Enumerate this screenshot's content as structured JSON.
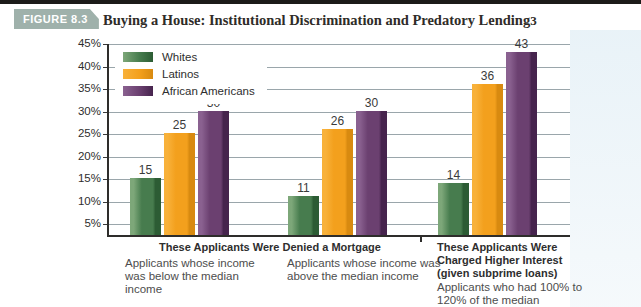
{
  "header": {
    "figure_label": "FIGURE 8.3",
    "title": "Buying a House: Institutional Discrimination and Predatory Lending",
    "footnote_marker": "3",
    "badge_color": "#9fb1ab"
  },
  "chart_data": {
    "type": "bar",
    "title": "Buying a House: Institutional Discrimination and Predatory Lending",
    "unit": "%",
    "grid": true,
    "legend_position": "top-left-inside-plot",
    "y_axis": {
      "visible_min": 5,
      "max": 45,
      "step": 5,
      "tick_suffix": "%"
    },
    "y_ticks": [
      {
        "value": 45,
        "label": "45%"
      },
      {
        "value": 40,
        "label": "40%"
      },
      {
        "value": 35,
        "label": "35%"
      },
      {
        "value": 30,
        "label": "30%"
      },
      {
        "value": 25,
        "label": "25%"
      },
      {
        "value": 20,
        "label": "20%"
      },
      {
        "value": 15,
        "label": "15%"
      },
      {
        "value": 10,
        "label": "10%"
      },
      {
        "value": 5,
        "label": "5%"
      }
    ],
    "sections": [
      {
        "heading": "These Applicants Were Denied a Mortgage",
        "group_indexes": [
          0,
          1
        ]
      },
      {
        "heading": "These Applicants Were Charged Higher Interest (given subprime loans)",
        "group_indexes": [
          2
        ]
      }
    ],
    "categories": [
      "Applicants whose income was below the median income",
      "Applicants whose income was above the median income",
      "Applicants who had 100% to 120% of the median"
    ],
    "series": [
      {
        "name": "Whites",
        "values": [
          15,
          11,
          14
        ],
        "color": {
          "light": "#7da779",
          "main": "#477c4e",
          "dark": "#2c5c34"
        }
      },
      {
        "name": "Latinos",
        "values": [
          25,
          26,
          36
        ],
        "color": {
          "light": "#f8b13a",
          "main": "#f3a01d",
          "dark": "#d88a10"
        }
      },
      {
        "name": "African Americans",
        "values": [
          30,
          30,
          43
        ],
        "color": {
          "light": "#8a6190",
          "main": "#6b4070",
          "dark": "#46244d"
        }
      }
    ]
  }
}
